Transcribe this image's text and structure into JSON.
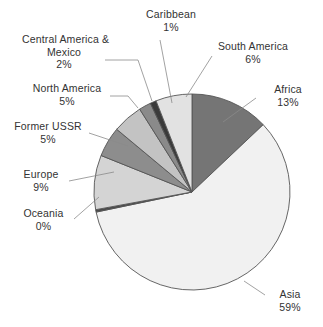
{
  "chart_data": {
    "type": "pie",
    "title": "",
    "subtitle": "",
    "xlabel": "",
    "ylabel": "",
    "legend_position": "labels-with-leader-lines",
    "grid": false,
    "total_percent": 100,
    "value_unit": "%",
    "start_angle_deg": 0,
    "direction": "clockwise",
    "categories": [
      "Africa",
      "Asia",
      "Oceania",
      "Europe",
      "Former USSR",
      "North America",
      "Central America & Mexico",
      "Caribbean",
      "South America"
    ],
    "values": [
      13,
      59,
      0,
      9,
      5,
      5,
      2,
      1,
      6
    ],
    "slices": [
      {
        "label": "Africa",
        "percent_text": "13%",
        "value": 13,
        "color": "#757575"
      },
      {
        "label": "Asia",
        "percent_text": "59%",
        "value": 59,
        "color": "#f1f1f1"
      },
      {
        "label": "Oceania",
        "percent_text": "0%",
        "value": 0.4,
        "color": "#4a4a4a"
      },
      {
        "label": "Europe",
        "percent_text": "9%",
        "value": 9,
        "color": "#d4d4d4"
      },
      {
        "label": "Former USSR",
        "percent_text": "5%",
        "value": 5,
        "color": "#8d8d8d"
      },
      {
        "label": "North America",
        "percent_text": "5%",
        "value": 5,
        "color": "#c3c3c3"
      },
      {
        "label": "Central America & Mexico",
        "percent_text": "2%",
        "value": 2,
        "color": "#8a8a8a"
      },
      {
        "label": "Caribbean",
        "percent_text": "1%",
        "value": 1,
        "color": "#3a3a3a"
      },
      {
        "label": "South America",
        "percent_text": "6%",
        "value": 6,
        "color": "#e2e2e2"
      }
    ]
  },
  "labels": {
    "caribbean": {
      "name": "Caribbean",
      "percent": "1%"
    },
    "central_america": {
      "name_line1": "Central America &",
      "name_line2": "Mexico",
      "percent": "2%"
    },
    "south_america": {
      "name": "South America",
      "percent": "6%"
    },
    "north_america": {
      "name": "North America",
      "percent": "5%"
    },
    "africa": {
      "name": "Africa",
      "percent": "13%"
    },
    "former_ussr": {
      "name": "Former USSR",
      "percent": "5%"
    },
    "europe": {
      "name": "Europe",
      "percent": "9%"
    },
    "oceania": {
      "name": "Oceania",
      "percent": "0%"
    },
    "asia": {
      "name": "Asia",
      "percent": "59%"
    }
  },
  "style": {
    "background": "#ffffff",
    "outline": "#555555",
    "leader_line": "#8a8a8a",
    "text": "#333333"
  }
}
